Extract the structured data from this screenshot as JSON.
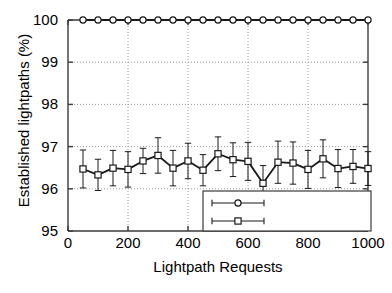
{
  "chart_data": {
    "type": "line",
    "title": "",
    "xlabel": "Lightpath Requests",
    "ylabel": "Established lightpaths (%)",
    "xlim": [
      0,
      1000
    ],
    "ylim": [
      95,
      100
    ],
    "xticks": [
      0,
      200,
      400,
      600,
      800,
      1000
    ],
    "yticks": [
      95,
      96,
      97,
      98,
      99,
      100
    ],
    "grid": true,
    "grid_style": "dotted",
    "legend_position": "bottom-right",
    "x": [
      50,
      100,
      150,
      200,
      250,
      300,
      350,
      400,
      450,
      500,
      550,
      600,
      650,
      700,
      750,
      800,
      850,
      900,
      950,
      1000
    ],
    "series": [
      {
        "name": "2 attempts",
        "marker": "circle",
        "values": [
          100,
          100,
          100,
          100,
          100,
          100,
          100,
          100,
          100,
          100,
          100,
          100,
          100,
          100,
          100,
          100,
          100,
          100,
          100,
          100
        ],
        "errors": [
          0,
          0,
          0,
          0,
          0,
          0,
          0,
          0,
          0,
          0,
          0,
          0,
          0,
          0,
          0,
          0,
          0,
          0,
          0,
          0
        ]
      },
      {
        "name": "1 attempt",
        "marker": "square",
        "values": [
          96.47,
          96.33,
          96.49,
          96.46,
          96.66,
          96.79,
          96.49,
          96.66,
          96.44,
          96.83,
          96.69,
          96.65,
          96.13,
          96.63,
          96.61,
          96.46,
          96.71,
          96.48,
          96.53,
          96.48
        ],
        "errors": [
          0.45,
          0.37,
          0.42,
          0.42,
          0.3,
          0.42,
          0.42,
          0.42,
          0.37,
          0.4,
          0.4,
          0.45,
          0.42,
          0.5,
          0.5,
          0.45,
          0.45,
          0.45,
          0.4,
          0.4
        ]
      }
    ]
  },
  "axes": {
    "ylabel": "Established lightpaths (%)",
    "xlabel": "Lightpath Requests",
    "ytick_labels": [
      "100",
      "99",
      "98",
      "97",
      "96",
      "95"
    ],
    "xtick_labels": [
      "0",
      "200",
      "400",
      "600",
      "800",
      "1000"
    ]
  },
  "legend": {
    "entries": [
      {
        "label": "2 attempts",
        "marker": "circle"
      },
      {
        "label": "1 attempt",
        "marker": "square"
      }
    ]
  },
  "colors": {
    "line": "#1a1a1a",
    "axis": "#3a3a3a",
    "grid": "#9a9a9a",
    "background": "#ffffff",
    "text": "#000000"
  }
}
